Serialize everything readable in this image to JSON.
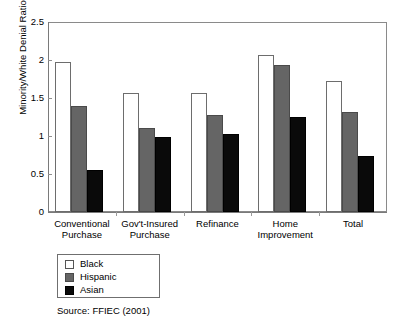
{
  "chart_data": {
    "type": "bar",
    "title": "",
    "subtitle": "",
    "xlabel": "",
    "ylabel": "Minority/White Denial Ratio",
    "ylim": [
      0,
      2.5
    ],
    "yticks": [
      "0",
      "0.5",
      "1",
      "1.5",
      "2",
      "2.5"
    ],
    "ytick_values": [
      0,
      0.5,
      1,
      1.5,
      2,
      2.5
    ],
    "grid": false,
    "legend_position": "below-left",
    "categories": [
      "Conventional\nPurchase",
      "Gov't-Insured\nPurchase",
      "Refinance",
      "Home\nImprovement",
      "Total"
    ],
    "series": [
      {
        "name": "Black",
        "values": [
          1.98,
          1.56,
          1.57,
          2.06,
          1.73
        ]
      },
      {
        "name": "Hispanic",
        "values": [
          1.4,
          1.1,
          1.28,
          1.93,
          1.31
        ]
      },
      {
        "name": "Asian",
        "values": [
          0.55,
          0.99,
          1.02,
          1.25,
          0.74
        ]
      }
    ],
    "annotations": [
      "Source: FFIEC (2001)"
    ]
  },
  "legend": {
    "items": [
      {
        "label": "Black",
        "swatch": "white-swatch"
      },
      {
        "label": "Hispanic",
        "swatch": "gray-swatch"
      },
      {
        "label": "Asian",
        "swatch": "black-swatch"
      }
    ]
  },
  "source_note": "Source: FFIEC (2001)",
  "colors": {
    "black_series": "#FFFFFF",
    "hispanic_series": "#656565",
    "asian_series": "#0A0A0A",
    "axis": "#7A7A7A",
    "text": "#000000",
    "background": "#FFFFFF"
  }
}
